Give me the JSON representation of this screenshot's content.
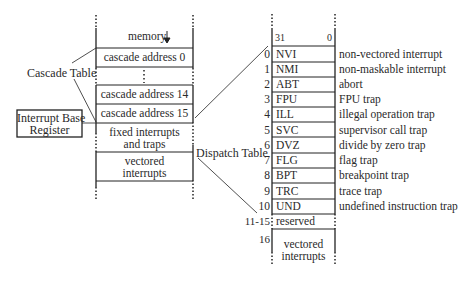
{
  "labels": {
    "cascade_table": "Cascade Table",
    "interrupt_base_register": [
      "Interrupt Base",
      "Register"
    ],
    "dispatch_table": "Dispatch Table"
  },
  "cascade_table": {
    "rows": [
      {
        "label": "memory",
        "note": "arrow-down"
      },
      {
        "label": "cascade address 0"
      },
      {
        "label": "⋮"
      },
      {
        "label": "cascade address 14"
      },
      {
        "label": "cascade address 15"
      },
      {
        "label": [
          "fixed interrupts",
          "and traps"
        ]
      },
      {
        "label": [
          "vectored",
          "interrupts"
        ]
      }
    ]
  },
  "dispatch_table": {
    "header": {
      "high_bit": "31",
      "low_bit": "0"
    },
    "entries": [
      {
        "index": "0",
        "code": "NVI",
        "description": "non-vectored interrupt"
      },
      {
        "index": "1",
        "code": "NMI",
        "description": "non-maskable interrupt"
      },
      {
        "index": "2",
        "code": "ABT",
        "description": "abort"
      },
      {
        "index": "3",
        "code": "FPU",
        "description": "FPU trap"
      },
      {
        "index": "4",
        "code": "ILL",
        "description": "illegal operation trap"
      },
      {
        "index": "5",
        "code": "SVC",
        "description": "supervisor call trap"
      },
      {
        "index": "6",
        "code": "DVZ",
        "description": "divide by zero trap"
      },
      {
        "index": "7",
        "code": "FLG",
        "description": "flag trap"
      },
      {
        "index": "8",
        "code": "BPT",
        "description": "breakpoint trap"
      },
      {
        "index": "9",
        "code": "TRC",
        "description": "trace trap"
      },
      {
        "index": "10",
        "code": "UND",
        "description": "undefined instruction trap"
      }
    ],
    "reserved": {
      "index": "11-15",
      "label": "reserved"
    },
    "vectored": {
      "index": "16",
      "label": [
        "vectored",
        "interrupts"
      ]
    }
  }
}
